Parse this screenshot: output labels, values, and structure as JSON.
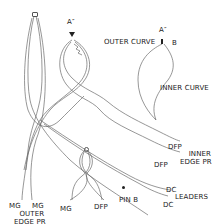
{
  "diagram": {
    "labels": {
      "a_double_prime_main": "A″",
      "a_double_prime_inset": "A″",
      "outer_curve": "OUTER CURVE",
      "b": "B",
      "inner_curve": "INNER CURVE",
      "dfp_upper": "DFP",
      "inner_edge_pr_line1": "INNER",
      "inner_edge_pr_line2": "EDGE PR",
      "dfp_lower": "DFP",
      "dc_upper": "DC",
      "leaders": "LEADERS",
      "dc_lower": "DC",
      "pin_b": "PIN B",
      "mg_left": "MG",
      "mg_right": "MG",
      "outer_edge_pr_line1": "OUTER",
      "outer_edge_pr_line2": "EDGE PR",
      "mg_center": "MG",
      "dfp_center": "DFP"
    },
    "markers": {
      "top_loop_pin": "small-ring",
      "a_pin": "triangle-pin",
      "center_loop_pin": "small-ring",
      "pin_b": "dot"
    },
    "colors": {
      "line": "#6a6a6a",
      "text": "#222222",
      "background": "#ffffff"
    }
  }
}
